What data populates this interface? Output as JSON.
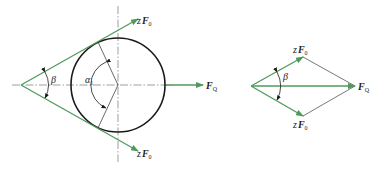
{
  "colors": {
    "force_green": "#4f9a5a",
    "outline": "#1a1a1a",
    "thin": "#555555",
    "centerline": "#777777"
  },
  "left_diagram": {
    "labels": {
      "upper_force": {
        "prefix": "z",
        "symbol": "F",
        "subscript": "0"
      },
      "lower_force": {
        "prefix": "z",
        "symbol": "F",
        "subscript": "0"
      },
      "resultant": {
        "symbol": "F",
        "subscript": "Q"
      },
      "wedge_angle": "β",
      "wrap_angle": {
        "symbol": "α",
        "subscript": "1"
      }
    }
  },
  "right_diagram": {
    "labels": {
      "upper_force": {
        "prefix": "z",
        "symbol": "F",
        "subscript": "0"
      },
      "lower_force": {
        "prefix": "z",
        "symbol": "F",
        "subscript": "0"
      },
      "resultant": {
        "symbol": "F",
        "subscript": "Q"
      },
      "wedge_angle": "β"
    }
  }
}
